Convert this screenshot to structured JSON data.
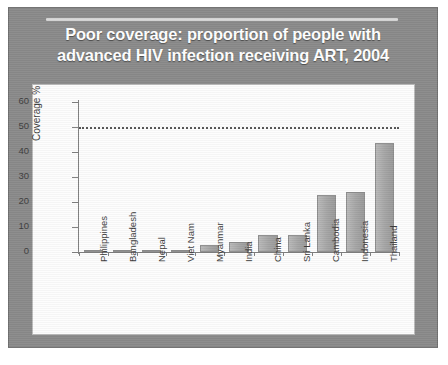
{
  "slide": {
    "title": "Poor coverage: proportion of people with advanced HIV infection receiving ART, 2004",
    "title_line1": "Poor coverage: proportion of people with",
    "title_line2": "advanced HIV infection receiving ART, 2004",
    "background_color": "#8a8a8a",
    "title_color": "#ffffff"
  },
  "chart_data": {
    "type": "bar",
    "title": "Poor coverage: proportion of people with advanced HIV infection receiving ART, 2004",
    "xlabel": "",
    "ylabel": "Coverage %",
    "ylim": [
      0,
      60
    ],
    "yticks": [
      0,
      10,
      20,
      30,
      40,
      50,
      60
    ],
    "ytick_labels": [
      "0",
      "10",
      "20",
      "30",
      "40",
      "50",
      "60"
    ],
    "grid": false,
    "legend": "none",
    "bar_color": "#a6a6a6",
    "bar_edge_color": "#8d8d8d",
    "categories": [
      "Philippines",
      "Bangladesh",
      "Nepal",
      "Viet Nam",
      "Myanmar",
      "India",
      "China",
      "Sri Lanka",
      "Cambodia",
      "Indonesia",
      "Thailand"
    ],
    "values": [
      0.3,
      1,
      1,
      1,
      3,
      4,
      7,
      7,
      23,
      24,
      43.5
    ],
    "annotations": [
      {
        "type": "reference-line",
        "label": "50% target",
        "value": 50,
        "style": "dotted",
        "color": "#555555"
      }
    ]
  }
}
